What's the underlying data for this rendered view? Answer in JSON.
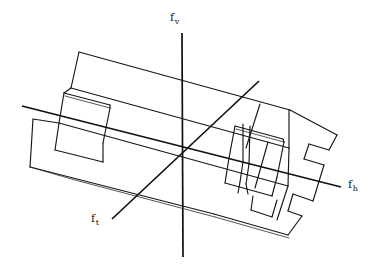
{
  "figure": {
    "kind": "engineering-line-drawing",
    "background_color": "#ffffff",
    "line_color": "#161616"
  },
  "axes": {
    "vertical": {
      "name": "f-vertical-axis",
      "label_base": "f",
      "label_sub": "v",
      "label": "fv",
      "x1": 182,
      "y1": 33,
      "x2": 183,
      "y2": 257
    },
    "horizontal": {
      "name": "f-horizontal-axis",
      "label_base": "f",
      "label_sub": "h",
      "label": "fh",
      "x1": 22,
      "y1": 106,
      "x2": 341,
      "y2": 187
    },
    "third": {
      "name": "f-tangential-axis",
      "label_base": "f",
      "label_sub": "t",
      "label": "ft",
      "x1": 112,
      "y1": 219,
      "x2": 259,
      "y2": 81
    },
    "origin": {
      "x": 182,
      "y": 152
    }
  },
  "part_outline": {
    "top_face": "M 79 52 L 289 110 L 290 110",
    "left_end": "M 79 52 L 72 88",
    "body_paths": [
      "M 79 52 L 289 110",
      "M 72 88 L 64 93",
      "M 30 167 L 33 120",
      "M 33 120 L 66 122",
      "M 66 122 L 70 95"
    ]
  },
  "features": {
    "left_slot": "rectangular pocket on left side",
    "right_nested_slots": "nested rectangular pockets on right side",
    "right_step_notch": "stepped notch on right edge",
    "bottom_notch": "notch on lower right edge"
  }
}
